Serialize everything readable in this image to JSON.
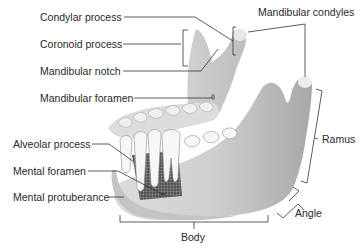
{
  "diagram": {
    "labels": {
      "condylar_process": "Condylar process",
      "coronoid_process": "Coronoid process",
      "mandibular_notch": "Mandibular notch",
      "mandibular_foramen": "Mandibular foramen",
      "mandibular_condyles": "Mandibular condyles",
      "ramus": "Ramus",
      "alveolar_process": "Alveolar process",
      "mental_foramen": "Mental foramen",
      "mental_protuberance": "Mental protuberance",
      "body": "Body",
      "angle": "Angle"
    },
    "colors": {
      "background": "#ffffff",
      "text": "#2a2a2a",
      "leader_line": "#333333",
      "bone_light": "#e6e6e6",
      "bone_mid": "#c9c9c9",
      "bone_dark": "#9a9a9a",
      "tooth": "#f4f4f4",
      "spongy_bone": "#555555"
    }
  }
}
